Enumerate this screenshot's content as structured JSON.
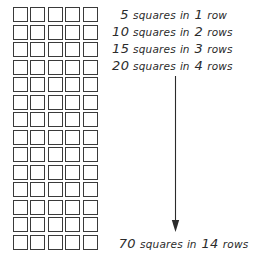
{
  "figure": {
    "background_color": "#ffffff",
    "ink_color": "#2b2b2b",
    "square_border_color": "#3a3a3a"
  },
  "grid": {
    "columns": 5,
    "rows": 14,
    "total_squares": 70,
    "cell_fill": "#ffffff"
  },
  "labels": [
    {
      "count": "5",
      "noun": "squares",
      "preposition": "in",
      "rows": "1",
      "rows_noun": "row"
    },
    {
      "count": "10",
      "noun": "squares",
      "preposition": "in",
      "rows": "2",
      "rows_noun": "rows"
    },
    {
      "count": "15",
      "noun": "squares",
      "preposition": "in",
      "rows": "3",
      "rows_noun": "rows"
    },
    {
      "count": "20",
      "noun": "squares",
      "preposition": "in",
      "rows": "4",
      "rows_noun": "rows"
    }
  ],
  "total": {
    "count": "70",
    "noun": "squares",
    "preposition": "in",
    "rows": "14",
    "rows_noun": "rows"
  },
  "arrow": {
    "direction": "down",
    "icon": "down-arrow-icon"
  }
}
